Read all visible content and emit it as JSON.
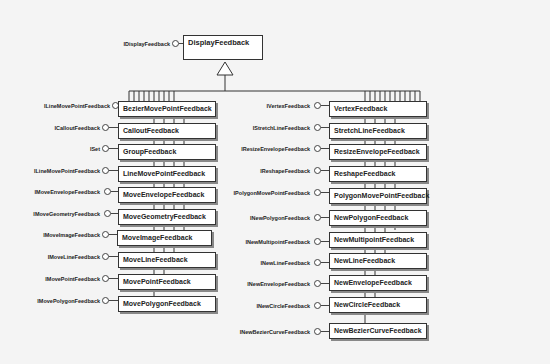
{
  "diagram": {
    "root": {
      "class": "DisplayFeedback",
      "interface": "IDisplayFeedback"
    },
    "left_column": [
      {
        "class": "BezierMovePointFeedback",
        "interface": "ILineMovePointFeedback"
      },
      {
        "class": "CalloutFeedback",
        "interface": "ICalloutFeedback"
      },
      {
        "class": "GroupFeedback",
        "interface": "ISet"
      },
      {
        "class": "LineMovePointFeedback",
        "interface": "ILineMovePointFeedback"
      },
      {
        "class": "MoveEnvelopeFeedback",
        "interface": "IMoveEnvelopeFeedback"
      },
      {
        "class": "MoveGeometryFeedback",
        "interface": "IMoveGeometryFeedback"
      },
      {
        "class": "MoveImageFeedback",
        "interface": "IMoveImageFeedback"
      },
      {
        "class": "MoveLineFeedback",
        "interface": "IMoveLineFeedback"
      },
      {
        "class": "MovePointFeedback",
        "interface": "IMovePointFeedback"
      },
      {
        "class": "MovePolygonFeedback",
        "interface": "IMovePolygonFeedback"
      }
    ],
    "right_column": [
      {
        "class": "VertexFeedback",
        "interface": "IVertexFeedback"
      },
      {
        "class": "StretchLineFeedback",
        "interface": "IStretchLineFeedback"
      },
      {
        "class": "ResizeEnvelopeFeedback",
        "interface": "IResizeEnvelopeFeedback"
      },
      {
        "class": "ReshapeFeedback",
        "interface": "IReshapeFeedback"
      },
      {
        "class": "PolygonMovePointFeedback",
        "interface": "IPolygonMovePointFeedback"
      },
      {
        "class": "NewPolygonFeedback",
        "interface": "INewPolygonFeedback"
      },
      {
        "class": "NewMultipointFeedback",
        "interface": "INewMultipointFeedback"
      },
      {
        "class": "NewLineFeedback",
        "interface": "INewLineFeedback"
      },
      {
        "class": "NewEnvelopeFeedback",
        "interface": "INewEnvelopeFeedback"
      },
      {
        "class": "NewCircleFeedback",
        "interface": "INewCircleFeedback"
      },
      {
        "class": "NewBezierCurveFeedback",
        "interface": "INewBezierCurveFeedback"
      }
    ]
  }
}
